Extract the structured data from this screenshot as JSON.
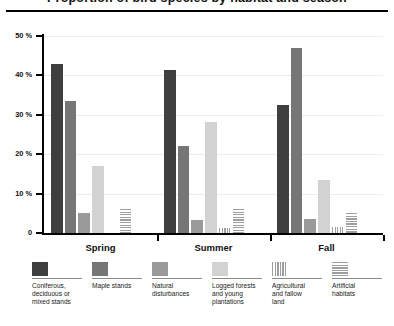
{
  "title": "Proportion of bird species by habitat and season",
  "axis": {
    "y_ticks": [
      "50 %",
      "40 %",
      "30 %",
      "20 %",
      "10 %",
      "0"
    ],
    "y_label": "",
    "x_label": ""
  },
  "groups": [
    "Spring",
    "Summer",
    "Fall"
  ],
  "legend": [
    {
      "label": "Coniferous,\ndeciduous or\nmixed stands",
      "color": "#3f3f3f",
      "pattern": "solid"
    },
    {
      "label": "Maple stands",
      "color": "#767676",
      "pattern": "solid"
    },
    {
      "label": "Natural\ndisturbances",
      "color": "#9a9a9a",
      "pattern": "solid"
    },
    {
      "label": "Logged forests\nand young\nplantations",
      "color": "#d2d2d2",
      "pattern": "solid"
    },
    {
      "label": "Agricultural\nand fallow\nland",
      "color": "#9e9e9e",
      "pattern": "vertical-stripes"
    },
    {
      "label": "Artificial\nhabitats",
      "color": "#9e9e9e",
      "pattern": "horizontal-stripes"
    }
  ],
  "chart_data": {
    "type": "bar",
    "title": "Proportion of bird species by habitat and season",
    "xlabel": "",
    "ylabel": "%",
    "ylim": [
      0,
      50
    ],
    "yticks": [
      0,
      10,
      20,
      30,
      40,
      50
    ],
    "grid": true,
    "legend_position": "bottom",
    "categories": [
      "Spring",
      "Summer",
      "Fall"
    ],
    "series": [
      {
        "name": "Coniferous, deciduous or mixed stands",
        "values": [
          43.0,
          41.5,
          32.5
        ],
        "color": "#3f3f3f"
      },
      {
        "name": "Maple stands",
        "values": [
          33.5,
          22.0,
          47.0
        ],
        "color": "#767676"
      },
      {
        "name": "Natural disturbances",
        "values": [
          5.0,
          3.2,
          3.5
        ],
        "color": "#9a9a9a"
      },
      {
        "name": "Logged forests and young plantations",
        "values": [
          17.0,
          28.3,
          13.5
        ],
        "color": "#d2d2d2"
      },
      {
        "name": "Agricultural and fallow land",
        "values": [
          0,
          1.2,
          1.5
        ],
        "color": "#9e9e9e"
      },
      {
        "name": "Artificial habitats",
        "values": [
          6.2,
          6.2,
          5.0
        ],
        "color": "#9e9e9e"
      }
    ]
  }
}
